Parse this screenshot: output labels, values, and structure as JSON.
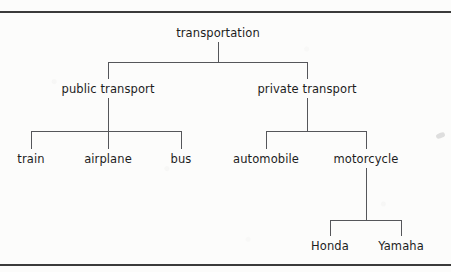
{
  "diagram": {
    "line_color": "#55565a",
    "rule_color": "#3b3b3b",
    "text_color": "#1d1d1d",
    "background": "#fcfcfb"
  },
  "nodes": {
    "root": "transportation",
    "public_transport": "public transport",
    "private_transport": "private transport",
    "train": "train",
    "airplane": "airplane",
    "bus": "bus",
    "automobile": "automobile",
    "motorcycle": "motorcycle",
    "honda": "Honda",
    "yamaha": "Yamaha"
  },
  "tree": {
    "label": "transportation",
    "children": [
      {
        "label": "public transport",
        "children": [
          {
            "label": "train",
            "children": []
          },
          {
            "label": "airplane",
            "children": []
          },
          {
            "label": "bus",
            "children": []
          }
        ]
      },
      {
        "label": "private transport",
        "children": [
          {
            "label": "automobile",
            "children": []
          },
          {
            "label": "motorcycle",
            "children": [
              {
                "label": "Honda",
                "children": []
              },
              {
                "label": "Yamaha",
                "children": []
              }
            ]
          }
        ]
      }
    ]
  }
}
